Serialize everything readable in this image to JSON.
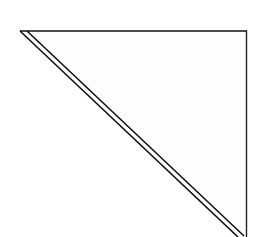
{
  "diagram": {
    "shape": "right-triangle",
    "fill": "#fdfdfd",
    "stroke": "#111111",
    "vertices": {
      "top_left": [
        20,
        31
      ],
      "top_right": [
        246,
        31
      ],
      "bottom_right": [
        246,
        234
      ]
    },
    "hypotenuse_style": "double-line"
  }
}
